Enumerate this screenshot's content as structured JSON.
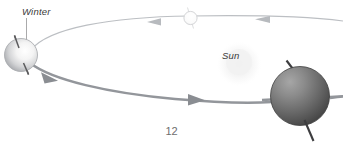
{
  "figure": {
    "type": "diagram",
    "background_color": "#ffffff",
    "labels": {
      "winter": "Winter",
      "sun": "Sun"
    },
    "page_number": "12",
    "colors": {
      "orbit_line_far": "#b9bcc0",
      "orbit_line_near": "#8e9196",
      "arrow_far": "#b9bcc0",
      "arrow_near": "#85888d",
      "earth_light_edge": "#b2b4b8",
      "earth_light_fill": "#f2f2f2",
      "earth_dark_edge": "#4a4a4a",
      "earth_dark_fill": "#8f8f8f",
      "axis_line": "#58585a",
      "leader_line": "#9a9a9c",
      "sun_glow": "#f0f0f0",
      "label_text": "#3a3a3a",
      "page_text": "#6e6e6e"
    },
    "elements": {
      "far_orbit": {
        "name": "far-orbit-path",
        "direction": "leftward",
        "arrow_count": 2
      },
      "near_orbit": {
        "name": "near-orbit-path",
        "direction": "rightward",
        "arrow_count": 2
      },
      "earth_winter": {
        "name": "earth-winter-position",
        "shading": "light",
        "axis_tilt_degrees": 23
      },
      "earth_summer": {
        "name": "earth-summer-position",
        "shading": "dark",
        "axis_tilt_degrees": 23
      },
      "earth_far": {
        "name": "earth-far-position",
        "shading": "outline",
        "axis_tilt_degrees": 23
      },
      "sun": {
        "name": "sun-body",
        "shading": "glow"
      }
    }
  }
}
